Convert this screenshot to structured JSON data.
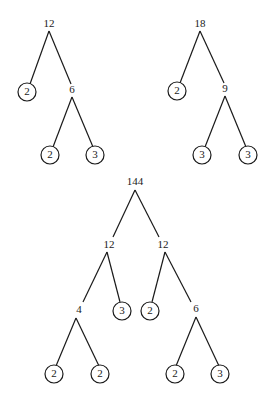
{
  "diagram": {
    "type": "factor-trees",
    "trees": [
      {
        "root": "12",
        "nodes": {
          "root": {
            "label": "12"
          },
          "l": {
            "label": "2",
            "prime": true
          },
          "r": {
            "label": "6"
          },
          "rl": {
            "label": "2",
            "prime": true
          },
          "rr": {
            "label": "3",
            "prime": true
          }
        }
      },
      {
        "root": "18",
        "nodes": {
          "root": {
            "label": "18"
          },
          "l": {
            "label": "2",
            "prime": true
          },
          "r": {
            "label": "9"
          },
          "rl": {
            "label": "3",
            "prime": true
          },
          "rr": {
            "label": "3",
            "prime": true
          }
        }
      },
      {
        "root": "144",
        "nodes": {
          "root": {
            "label": "144"
          },
          "l": {
            "label": "12"
          },
          "r": {
            "label": "12"
          },
          "ll": {
            "label": "4"
          },
          "lr": {
            "label": "3",
            "prime": true
          },
          "rl": {
            "label": "2",
            "prime": true
          },
          "rr": {
            "label": "6"
          },
          "lll": {
            "label": "2",
            "prime": true
          },
          "llr": {
            "label": "2",
            "prime": true
          },
          "rrl": {
            "label": "2",
            "prime": true
          },
          "rrr": {
            "label": "3",
            "prime": true
          }
        }
      }
    ],
    "colors": {
      "stroke": "#1a1a1a",
      "background": "#ffffff"
    }
  }
}
